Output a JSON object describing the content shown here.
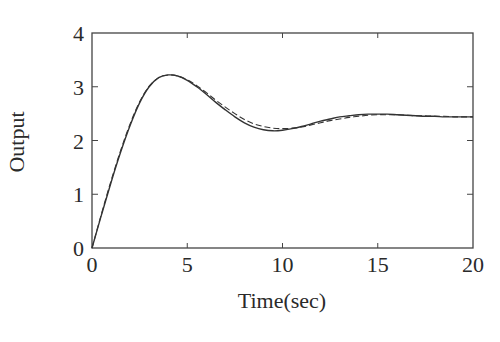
{
  "chart_data": {
    "type": "line",
    "title": "",
    "xlabel": "Time(sec)",
    "ylabel": "Output",
    "xlim": [
      0,
      20
    ],
    "ylim": [
      0,
      4
    ],
    "xticks": [
      0,
      5,
      10,
      15,
      20
    ],
    "yticks": [
      0,
      1,
      2,
      3,
      4
    ],
    "grid": false,
    "legend": null,
    "series": [
      {
        "name": "solid",
        "style": "solid",
        "x": [
          0,
          0.5,
          1,
          1.5,
          2,
          2.5,
          3,
          3.5,
          4,
          4.5,
          5,
          5.5,
          6,
          6.5,
          7,
          7.5,
          8,
          8.5,
          9,
          9.5,
          10,
          10.5,
          11,
          11.5,
          12,
          12.5,
          13,
          13.5,
          14,
          14.5,
          15,
          15.5,
          16,
          16.5,
          17,
          17.5,
          18,
          18.5,
          19,
          19.5,
          20
        ],
        "values": [
          0,
          0.62,
          1.22,
          1.78,
          2.28,
          2.7,
          3.0,
          3.17,
          3.22,
          3.2,
          3.12,
          3.0,
          2.86,
          2.71,
          2.57,
          2.44,
          2.33,
          2.25,
          2.2,
          2.18,
          2.19,
          2.22,
          2.26,
          2.31,
          2.36,
          2.4,
          2.44,
          2.46,
          2.48,
          2.49,
          2.49,
          2.49,
          2.48,
          2.47,
          2.46,
          2.45,
          2.45,
          2.44,
          2.44,
          2.44,
          2.44
        ]
      },
      {
        "name": "dashed",
        "style": "dashed",
        "x": [
          0,
          0.5,
          1,
          1.5,
          2,
          2.5,
          3,
          3.5,
          4,
          4.5,
          5,
          5.5,
          6,
          6.5,
          7,
          7.5,
          8,
          8.5,
          9,
          9.5,
          10,
          10.5,
          11,
          11.5,
          12,
          12.5,
          13,
          13.5,
          14,
          14.5,
          15,
          15.5,
          16,
          16.5,
          17,
          17.5,
          18,
          18.5,
          19,
          19.5,
          20
        ],
        "values": [
          0,
          0.64,
          1.25,
          1.81,
          2.31,
          2.72,
          3.01,
          3.17,
          3.22,
          3.2,
          3.13,
          3.02,
          2.89,
          2.75,
          2.62,
          2.5,
          2.39,
          2.31,
          2.26,
          2.23,
          2.22,
          2.23,
          2.25,
          2.29,
          2.33,
          2.37,
          2.4,
          2.43,
          2.45,
          2.47,
          2.48,
          2.48,
          2.48,
          2.47,
          2.46,
          2.46,
          2.45,
          2.45,
          2.44,
          2.44,
          2.44
        ]
      }
    ]
  },
  "axes": {
    "xlabel": "Time(sec)",
    "ylabel": "Output",
    "xtick_labels": [
      "0",
      "5",
      "10",
      "15",
      "20"
    ],
    "ytick_labels": [
      "0",
      "1",
      "2",
      "3",
      "4"
    ]
  }
}
